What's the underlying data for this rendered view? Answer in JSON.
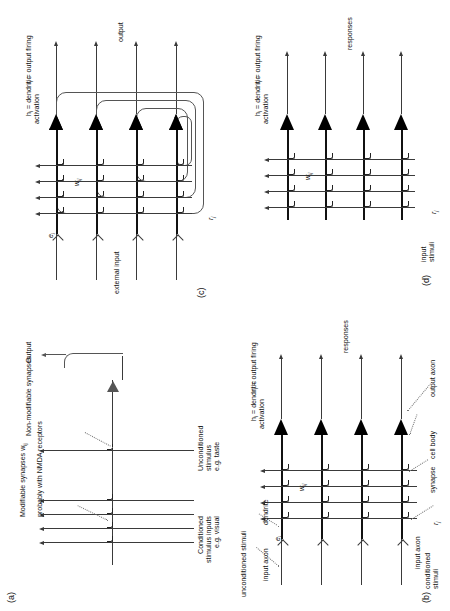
{
  "figure": {
    "orientation": "rotated-90-ccw",
    "panels": [
      "a",
      "b",
      "c",
      "d"
    ]
  },
  "panel_a": {
    "key": "(a)",
    "labels": {
      "conditioned": "Conditioned\nstimulus inputs\ne.g. visual",
      "unconditioned": "Unconditioned\nstimulus\ne.g. taste",
      "modifiable": "Modifiable synapses w",
      "modifiable_sub": "ij",
      "modifiable_line2": "probably with NMDA receptors",
      "nonmodifiable": "Non-modifiable synapses",
      "output": "Output"
    }
  },
  "panel_b": {
    "key": "(b)",
    "labels": {
      "unconditioned_stimuli": "unconditioned stimuli",
      "conditioned_stimuli": "conditioned\nstimuli",
      "input_axon_top": "input axon",
      "input_axon_bottom": "input axon",
      "dendrite": "dendrite",
      "synapse": "synapse",
      "cell_body": "cell body",
      "output_axon": "output axon",
      "responses": "responses",
      "e_i": "e",
      "e_i_sub": "i",
      "r_j": "r",
      "r_j_sub": "j",
      "w_ij": "w",
      "w_ij_sub": "ij",
      "h_i": "h",
      "h_i_sub": "i",
      "h_i_text": " = dendritic\nactivation",
      "r_i": "r",
      "r_i_sub": "i",
      "r_i_text": " = output firing"
    }
  },
  "panel_c": {
    "key": "(c)",
    "labels": {
      "external_input": "external input",
      "output": "output",
      "e_i": "e",
      "e_i_sub": "i",
      "r_j": "r",
      "r_j_sub": "j",
      "w_ij": "w",
      "w_ij_sub": "ij",
      "h_i": "h",
      "h_i_sub": "i",
      "h_i_text": " = dendritic\nactivation",
      "r_i": "r",
      "r_i_sub": "i",
      "r_i_text": " = output firing"
    }
  },
  "panel_d": {
    "key": "(d)",
    "labels": {
      "input_stimuli": "input\nstimuli",
      "responses": "responses",
      "r_j": "r",
      "r_j_sub": "j",
      "w_ij": "w",
      "w_ij_sub": "ij",
      "h_i": "h",
      "h_i_sub": "i",
      "h_i_text": " = dendritic\nactivation",
      "r_i": "r",
      "r_i_sub": "i",
      "r_i_text": " = output firing"
    }
  },
  "colors": {
    "ink": "#111111",
    "line": "#3a3a3a",
    "lead": "#777777",
    "paper": "#ffffff"
  }
}
